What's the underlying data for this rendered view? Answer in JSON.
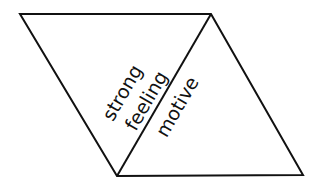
{
  "diagram": {
    "type": "rhombus-split-into-two-triangles",
    "labels": {
      "left_triangle_line1": "strong",
      "left_triangle_line2": "feeling",
      "right_triangle": "motive"
    },
    "colors": {
      "stroke": "#111111",
      "background": "#ffffff"
    }
  }
}
